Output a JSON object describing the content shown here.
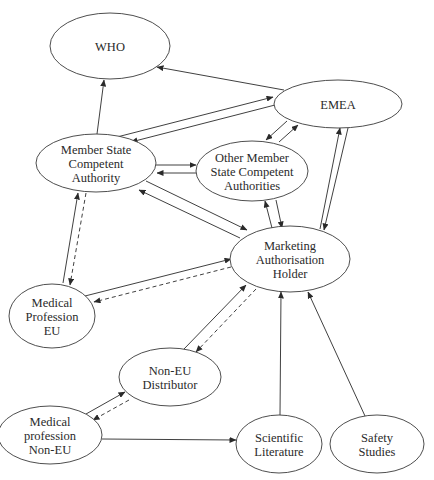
{
  "diagram": {
    "type": "flow-network",
    "nodes": [
      {
        "id": "who",
        "lines": [
          "WHO"
        ],
        "cx": 110,
        "cy": 46,
        "rx": 60,
        "ry": 33
      },
      {
        "id": "emea",
        "lines": [
          "EMEA"
        ],
        "cx": 338,
        "cy": 104,
        "rx": 64,
        "ry": 24
      },
      {
        "id": "msca",
        "lines": [
          "Member State",
          "Competent",
          "Authority"
        ],
        "cx": 96,
        "cy": 163,
        "rx": 60,
        "ry": 29
      },
      {
        "id": "omsca",
        "lines": [
          "Other Member",
          "State Competent",
          "Authorities"
        ],
        "cx": 252,
        "cy": 171,
        "rx": 56,
        "ry": 30
      },
      {
        "id": "mah",
        "lines": [
          "Marketing",
          "Authorisation",
          "Holder"
        ],
        "cx": 290,
        "cy": 259,
        "rx": 60,
        "ry": 33
      },
      {
        "id": "mpeu",
        "lines": [
          "Medical",
          "Profession",
          "EU"
        ],
        "cx": 52,
        "cy": 316,
        "rx": 43,
        "ry": 32
      },
      {
        "id": "noneu_dist",
        "lines": [
          "Non-EU",
          "Distributor"
        ],
        "cx": 170,
        "cy": 377,
        "rx": 51,
        "ry": 29
      },
      {
        "id": "mp_noneu",
        "lines": [
          "Medical",
          "profession",
          "Non-EU"
        ],
        "cx": 50,
        "cy": 435,
        "rx": 52,
        "ry": 29
      },
      {
        "id": "scilit",
        "lines": [
          "Scientific",
          "Literature"
        ],
        "cx": 279,
        "cy": 444,
        "rx": 43,
        "ry": 29
      },
      {
        "id": "safety",
        "lines": [
          "Safety",
          "Studies"
        ],
        "cx": 377,
        "cy": 444,
        "rx": 47,
        "ry": 29
      }
    ],
    "edges": [
      {
        "from": "emea",
        "to": "who",
        "style": "solid",
        "x1": 284,
        "y1": 90,
        "x2": 157,
        "y2": 67
      },
      {
        "from": "msca",
        "to": "who",
        "style": "solid",
        "x1": 97,
        "y1": 134,
        "x2": 104,
        "y2": 80
      },
      {
        "from": "msca",
        "to": "emea",
        "style": "solid",
        "x1": 117,
        "y1": 137,
        "x2": 273,
        "y2": 97
      },
      {
        "from": "emea",
        "to": "msca",
        "style": "solid",
        "x1": 275,
        "y1": 105,
        "x2": 131,
        "y2": 142
      },
      {
        "from": "emea",
        "to": "omsca",
        "style": "solid",
        "x1": 287,
        "y1": 121,
        "x2": 266,
        "y2": 140
      },
      {
        "from": "omsca",
        "to": "emea",
        "style": "solid",
        "x1": 279,
        "y1": 142,
        "x2": 298,
        "y2": 125
      },
      {
        "from": "msca",
        "to": "omsca",
        "style": "solid",
        "x1": 156,
        "y1": 165,
        "x2": 196,
        "y2": 165
      },
      {
        "from": "omsca",
        "to": "msca",
        "style": "solid",
        "x1": 196,
        "y1": 173,
        "x2": 157,
        "y2": 173
      },
      {
        "from": "msca",
        "to": "mah",
        "style": "solid",
        "x1": 146,
        "y1": 181,
        "x2": 247,
        "y2": 230
      },
      {
        "from": "mah",
        "to": "msca",
        "style": "solid",
        "x1": 240,
        "y1": 238,
        "x2": 139,
        "y2": 190
      },
      {
        "from": "mah",
        "to": "omsca",
        "style": "solid",
        "x1": 272,
        "y1": 228,
        "x2": 265,
        "y2": 201
      },
      {
        "from": "omsca",
        "to": "mah",
        "style": "solid",
        "x1": 276,
        "y1": 200,
        "x2": 282,
        "y2": 228
      },
      {
        "from": "mah",
        "to": "emea",
        "style": "solid",
        "x1": 320,
        "y1": 229,
        "x2": 340,
        "y2": 128
      },
      {
        "from": "emea",
        "to": "mah",
        "style": "solid",
        "x1": 348,
        "y1": 128,
        "x2": 324,
        "y2": 230
      },
      {
        "from": "mpeu",
        "to": "msca",
        "style": "solid",
        "x1": 63,
        "y1": 283,
        "x2": 78,
        "y2": 193
      },
      {
        "from": "msca",
        "to": "mpeu",
        "style": "dashed",
        "x1": 86,
        "y1": 193,
        "x2": 70,
        "y2": 285
      },
      {
        "from": "mpeu",
        "to": "mah",
        "style": "solid",
        "x1": 85,
        "y1": 296,
        "x2": 231,
        "y2": 259
      },
      {
        "from": "mah",
        "to": "mpeu",
        "style": "dashed",
        "x1": 231,
        "y1": 267,
        "x2": 94,
        "y2": 302
      },
      {
        "from": "noneu_dist",
        "to": "mah",
        "style": "solid",
        "x1": 184,
        "y1": 349,
        "x2": 246,
        "y2": 285
      },
      {
        "from": "mah",
        "to": "noneu_dist",
        "style": "dashed",
        "x1": 256,
        "y1": 289,
        "x2": 196,
        "y2": 352
      },
      {
        "from": "mp_noneu",
        "to": "noneu_dist",
        "style": "solid",
        "x1": 86,
        "y1": 414,
        "x2": 125,
        "y2": 392
      },
      {
        "from": "noneu_dist",
        "to": "mp_noneu",
        "style": "dashed",
        "x1": 129,
        "y1": 400,
        "x2": 93,
        "y2": 420
      },
      {
        "from": "mp_noneu",
        "to": "scilit",
        "style": "solid",
        "x1": 102,
        "y1": 439,
        "x2": 236,
        "y2": 440
      },
      {
        "from": "scilit",
        "to": "mah",
        "style": "solid",
        "x1": 280,
        "y1": 415,
        "x2": 281,
        "y2": 292
      },
      {
        "from": "safety",
        "to": "mah",
        "style": "solid",
        "x1": 365,
        "y1": 416,
        "x2": 308,
        "y2": 292
      }
    ]
  },
  "colors": {
    "stroke": "#2a2a2a",
    "fill": "#ffffff",
    "text": "#2a2a2a"
  }
}
